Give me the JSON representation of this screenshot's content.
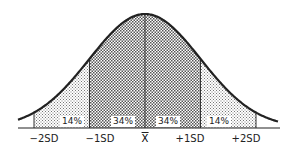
{
  "chart_data": {
    "type": "area",
    "title": "",
    "xlabel": "",
    "ylabel": "",
    "categories": [
      "-2SD",
      "-1SD",
      "X̄",
      "+1SD",
      "+2SD"
    ],
    "x": [
      -2,
      -1,
      0,
      1,
      2
    ],
    "regions": [
      {
        "from": -2,
        "to": -1,
        "label": "14%",
        "value": 14
      },
      {
        "from": -1,
        "to": 0,
        "label": "34%",
        "value": 34
      },
      {
        "from": 0,
        "to": 1,
        "label": "34%",
        "value": 34
      },
      {
        "from": 1,
        "to": 2,
        "label": "14%",
        "value": 14
      }
    ],
    "grid": false,
    "legend": "none"
  },
  "labels": {
    "m2": "−2SD",
    "m1": "−1SD",
    "mean": "X",
    "p1": "+1SD",
    "p2": "+2SD",
    "r1": "14%",
    "r2": "34%",
    "r3": "34%",
    "r4": "14%"
  },
  "colors": {
    "line": "#222222",
    "dark_fill": "#8a8a8a",
    "light_fill": "#c4c4c4"
  }
}
